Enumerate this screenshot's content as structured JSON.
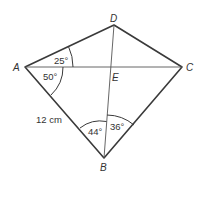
{
  "diagram": {
    "type": "kite-quadrilateral",
    "stroke_color": "#3a3a3a",
    "vertices": {
      "A": {
        "label": "A",
        "x": 25,
        "y": 67
      },
      "D": {
        "label": "D",
        "x": 114,
        "y": 25
      },
      "C": {
        "label": "C",
        "x": 182,
        "y": 67
      },
      "B": {
        "label": "B",
        "x": 104,
        "y": 158
      },
      "E": {
        "label": "E",
        "x": 111,
        "y": 67
      }
    },
    "angles": {
      "DAC": "25°",
      "CAB": "50°",
      "ABD": "44°",
      "DBC": "36°"
    },
    "lengths": {
      "AB": "12 cm"
    }
  }
}
